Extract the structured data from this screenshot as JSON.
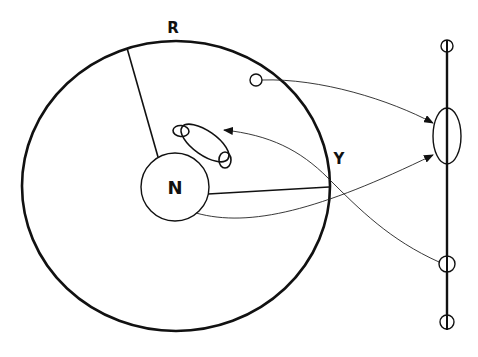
{
  "diagram": {
    "type": "schematic",
    "labels": {
      "rim": "R",
      "junction": "Y",
      "nucleus": "N"
    },
    "elements": [
      {
        "id": "outer-circle",
        "shape": "ellipse",
        "label": "R"
      },
      {
        "id": "inner-circle",
        "shape": "circle",
        "label": "N"
      },
      {
        "id": "radius-line-to-R",
        "shape": "line"
      },
      {
        "id": "radius-line-to-Y",
        "shape": "line"
      },
      {
        "id": "looped-path",
        "shape": "loops"
      },
      {
        "id": "small-node",
        "shape": "circle"
      },
      {
        "id": "vertical-axis",
        "shape": "line"
      },
      {
        "id": "axis-oval",
        "shape": "ellipse"
      },
      {
        "id": "axis-node-top",
        "shape": "circle"
      },
      {
        "id": "axis-node-mid",
        "shape": "circle"
      },
      {
        "id": "axis-node-bottom",
        "shape": "circle"
      }
    ],
    "arrows": [
      {
        "from": "small-node",
        "to": "axis-oval"
      },
      {
        "from": "inner-circle",
        "to": "axis-oval"
      },
      {
        "from": "axis-node-mid",
        "to": "looped-path"
      }
    ],
    "colors": {
      "stroke": "#111111",
      "background": "#ffffff"
    }
  }
}
